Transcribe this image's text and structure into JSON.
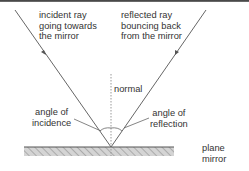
{
  "diagram": {
    "type": "ray-diagram",
    "labels": {
      "incident_ray": [
        "incident ray",
        "going towards",
        "the mirror"
      ],
      "reflected_ray": [
        "reflected ray",
        "bouncing back",
        "from the mirror"
      ],
      "normal": "normal",
      "angle_of_incidence": [
        "angle of",
        "incidence"
      ],
      "angle_of_reflection": [
        "angle of",
        "reflection"
      ],
      "mirror": [
        "plane",
        "mirror"
      ]
    },
    "colors": {
      "ray": "#666666",
      "text": "#333333",
      "normal_line": "#888888",
      "mirror_surface": "#555555",
      "mirror_hatch": "#aaaaaa"
    }
  }
}
